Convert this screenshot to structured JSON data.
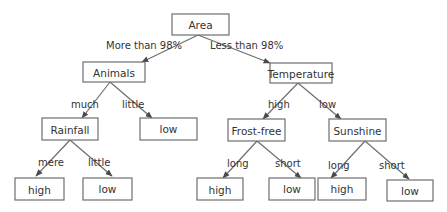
{
  "colors": {
    "box_stroke": "#6e6e6e",
    "text": "#333333",
    "background": "#ffffff"
  },
  "nodes": {
    "area": "Area",
    "animals": "Animals",
    "temperature": "Temperature",
    "rainfall": "Rainfall",
    "animals_low": "low",
    "frostfree": "Frost-free",
    "sunshine": "Sunshine",
    "rainfall_high": "high",
    "rainfall_low": "low",
    "frostfree_high": "high",
    "frostfree_low": "low",
    "sunshine_high": "high",
    "sunshine_low": "low"
  },
  "edges": [
    {
      "from": "area",
      "to": "animals",
      "label": "More than 98%"
    },
    {
      "from": "area",
      "to": "temperature",
      "label": "Less than 98%"
    },
    {
      "from": "animals",
      "to": "rainfall",
      "label": "much"
    },
    {
      "from": "animals",
      "to": "animals_low",
      "label": "little"
    },
    {
      "from": "temperature",
      "to": "frostfree",
      "label": "high"
    },
    {
      "from": "temperature",
      "to": "sunshine",
      "label": "low"
    },
    {
      "from": "rainfall",
      "to": "rainfall_high",
      "label": "mere"
    },
    {
      "from": "rainfall",
      "to": "rainfall_low",
      "label": "little"
    },
    {
      "from": "frostfree",
      "to": "frostfree_high",
      "label": "long"
    },
    {
      "from": "frostfree",
      "to": "frostfree_low",
      "label": "short"
    },
    {
      "from": "sunshine",
      "to": "sunshine_high",
      "label": "long"
    },
    {
      "from": "sunshine",
      "to": "sunshine_low",
      "label": "short"
    }
  ]
}
